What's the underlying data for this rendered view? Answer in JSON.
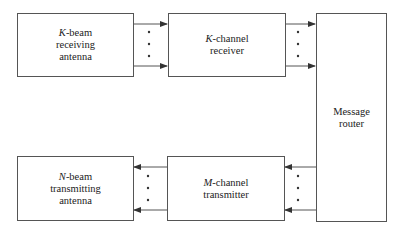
{
  "diagram": {
    "type": "block-diagram",
    "blocks": {
      "rx_antenna": {
        "var": "K",
        "line1_rest": "-beam",
        "line2": "receiving",
        "line3": "antenna"
      },
      "rx_channel": {
        "var": "K",
        "line1_rest": "-channel",
        "line2": "receiver"
      },
      "router": {
        "line1": "Message",
        "line2": "router"
      },
      "tx_antenna": {
        "var": "N",
        "line1_rest": "-beam",
        "line2": "transmitting",
        "line3": "antenna"
      },
      "tx_channel": {
        "var": "M",
        "line1_rest": "-channel",
        "line2": "transmitter"
      }
    },
    "connections": [
      {
        "from": "K-beam receiving antenna",
        "to": "K-channel receiver",
        "style": "multi-line arrows with ellipsis dots"
      },
      {
        "from": "K-channel receiver",
        "to": "Message router",
        "style": "multi-line arrows with ellipsis dots"
      },
      {
        "from": "Message router",
        "to": "M-channel transmitter",
        "style": "multi-line arrows with ellipsis dots"
      },
      {
        "from": "M-channel transmitter",
        "to": "N-beam transmitting antenna",
        "style": "multi-line arrows with ellipsis dots"
      }
    ],
    "colors": {
      "line": "#555555",
      "text": "#222222",
      "background": "#ffffff"
    }
  }
}
